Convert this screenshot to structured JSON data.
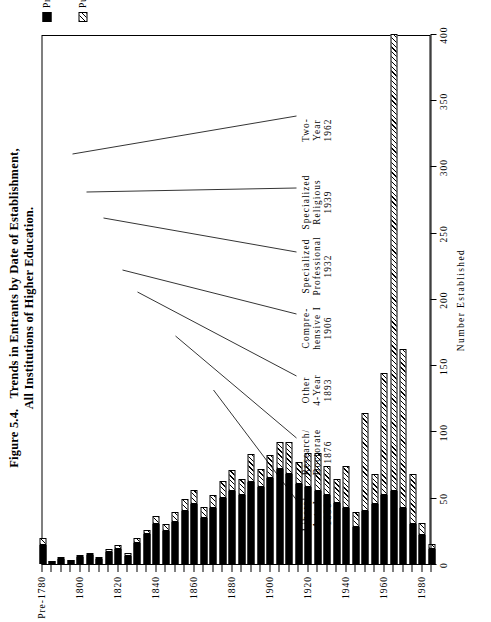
{
  "figure": {
    "number": "Figure 5.4.",
    "title_line1": "Trends in Entrants by Date of Establishment,",
    "title_line2": "All Institutions of Higher Education."
  },
  "legend": {
    "position": "right",
    "items": [
      {
        "label": "Private",
        "pattern": "solid-black",
        "color": "#000000"
      },
      {
        "label": "Public",
        "pattern": "diagonal-hatch",
        "color": "#000000"
      }
    ]
  },
  "annotations": [
    {
      "line1": "Liberal",
      "line2": "Arts I",
      "year": "1856",
      "target_year": 1855
    },
    {
      "line1": "Research/",
      "line2": "Doctorate",
      "year": "1876",
      "target_year": 1875
    },
    {
      "line1": "Other",
      "line2": "4-Year",
      "year": "1893",
      "target_year": 1890
    },
    {
      "line1": "Compre-",
      "line2": "hensive I",
      "year": "1906",
      "target_year": 1905
    },
    {
      "line1": "Specialized",
      "line2": "Professional",
      "year": "1932",
      "target_year": 1930
    },
    {
      "line1": "Specialized",
      "line2": "Religious",
      "year": "1939",
      "target_year": 1940
    },
    {
      "line1": "Two-",
      "line2": "Year",
      "year": "1962",
      "target_year": 1960
    }
  ],
  "chart_data": {
    "type": "bar",
    "orientation": "horizontal-rotated",
    "title": "Trends in Entrants by Date of Establishment, All Institutions of Higher Education.",
    "xlabel": "Number Established",
    "ylabel": "",
    "stacked": true,
    "grid": false,
    "xlim": [
      0,
      400
    ],
    "xticks": [
      0,
      50,
      100,
      150,
      200,
      250,
      300,
      350,
      400
    ],
    "xticklabels": [
      "0",
      "50",
      "100",
      "150",
      "200",
      "250",
      "300",
      "350",
      "400"
    ],
    "category_ticklabels": [
      "Pre-1780",
      "1800",
      "1820",
      "1840",
      "1860",
      "1880",
      "1900",
      "1920",
      "1940",
      "1960",
      "1980"
    ],
    "categories": [
      "Pre-1780",
      "1785",
      "1790",
      "1795",
      "1800",
      "1805",
      "1810",
      "1815",
      "1820",
      "1825",
      "1830",
      "1835",
      "1840",
      "1845",
      "1850",
      "1855",
      "1860",
      "1865",
      "1870",
      "1875",
      "1880",
      "1885",
      "1890",
      "1895",
      "1900",
      "1905",
      "1910",
      "1915",
      "1920",
      "1925",
      "1930",
      "1935",
      "1940",
      "1945",
      "1950",
      "1955",
      "1960",
      "1965",
      "1970",
      "1975",
      "1980",
      "1985"
    ],
    "series": [
      {
        "name": "Private",
        "color": "#000000",
        "values": [
          14,
          2,
          4,
          3,
          5,
          7,
          4,
          9,
          11,
          6,
          16,
          23,
          30,
          25,
          32,
          40,
          45,
          35,
          42,
          50,
          55,
          52,
          62,
          58,
          65,
          72,
          68,
          60,
          58,
          55,
          52,
          46,
          42,
          28,
          40,
          45,
          52,
          55,
          42,
          30,
          22,
          11
        ]
      },
      {
        "name": "Public",
        "color": "#ffffff",
        "hatch": "diagonal",
        "values": [
          6,
          0,
          1,
          0,
          2,
          1,
          1,
          2,
          3,
          2,
          4,
          3,
          6,
          5,
          7,
          9,
          11,
          8,
          10,
          13,
          16,
          12,
          21,
          14,
          17,
          20,
          24,
          17,
          26,
          29,
          22,
          18,
          32,
          11,
          74,
          23,
          92,
          345,
          120,
          38,
          9,
          4
        ]
      }
    ]
  }
}
